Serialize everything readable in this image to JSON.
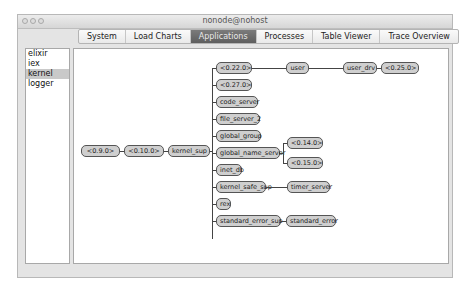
{
  "window": {
    "title": "nonode@nohost"
  },
  "tabs": [
    {
      "label": "System",
      "selected": false
    },
    {
      "label": "Load Charts",
      "selected": false
    },
    {
      "label": "Applications",
      "selected": true
    },
    {
      "label": "Processes",
      "selected": false
    },
    {
      "label": "Table Viewer",
      "selected": false
    },
    {
      "label": "Trace Overview",
      "selected": false
    }
  ],
  "applications": [
    {
      "label": "elixir",
      "selected": false
    },
    {
      "label": "iex",
      "selected": false
    },
    {
      "label": "kernel",
      "selected": true
    },
    {
      "label": "logger",
      "selected": false
    }
  ],
  "tree": {
    "root": "<0.9.0>",
    "master": "<0.10.0>",
    "supervisor": "kernel_sup",
    "children": [
      {
        "label": "<0.22.0>",
        "chain": [
          "user",
          "user_drv",
          "<0.25.0>"
        ]
      },
      {
        "label": "<0.27.0>"
      },
      {
        "label": "code_server"
      },
      {
        "label": "file_server_2"
      },
      {
        "label": "global_group"
      },
      {
        "label": "global_name_server",
        "branches": [
          "<0.14.0>",
          "<0.15.0>"
        ]
      },
      {
        "label": "inet_db"
      },
      {
        "label": "kernel_safe_sup",
        "chain": [
          "timer_server"
        ]
      },
      {
        "label": "rex"
      },
      {
        "label": "standard_error_sup",
        "chain": [
          "standard_error"
        ]
      }
    ]
  }
}
